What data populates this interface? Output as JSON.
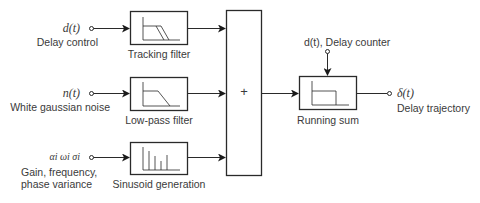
{
  "inputs": [
    {
      "symbol": "d(t)",
      "label": "Delay control"
    },
    {
      "symbol": "n(t)",
      "label": "White gaussian noise"
    },
    {
      "symbol": "αi ωi σi",
      "label_line1": "Gain, frequency,",
      "label_line2": "phase variance"
    }
  ],
  "blocks": {
    "tracking_filter": "Tracking filter",
    "lowpass_filter": "Low-pass filter",
    "sinusoid_generation": "Sinusoid generation",
    "summer_symbol": "+",
    "running_sum": "Running sum"
  },
  "counter_input": {
    "label": "d(t), Delay counter"
  },
  "output": {
    "symbol": "δ(t)",
    "label": "Delay trajectory"
  }
}
